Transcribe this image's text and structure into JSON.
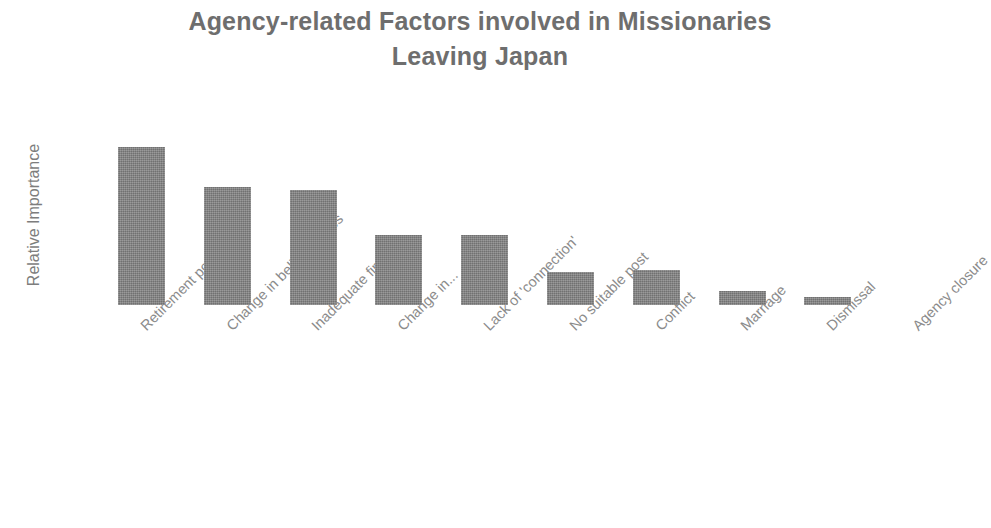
{
  "chart_data": {
    "type": "bar",
    "title": "Agency-related Factors involved in Missionaries\nLeaving Japan",
    "title_line1": "Agency-related Factors involved in Missionaries",
    "title_line2": "Leaving Japan",
    "xlabel": "",
    "ylabel": "Relative Importance",
    "ylim": [
      0,
      100
    ],
    "grid": false,
    "legend": false,
    "axis_tick_labels_y": [],
    "bar_color": "#848484",
    "text_color": "#8b8b8b",
    "title_color": "#6e6e6e",
    "categories": [
      "Retirement policy",
      "Change in beliefs/values",
      "Inadequate finance",
      "Change in...",
      "Lack of 'connection'",
      "No suitable post",
      "Conflict",
      "Marriage",
      "Dismissal",
      "Agency closure"
    ],
    "values": [
      100,
      75,
      73,
      44,
      44,
      21,
      22,
      9,
      5,
      0
    ],
    "series": [
      {
        "name": "Relative Importance",
        "values": [
          100,
          75,
          73,
          44,
          44,
          21,
          22,
          9,
          5,
          0
        ]
      }
    ]
  },
  "layout": {
    "baseline_y": 305,
    "plot_top_y": 140,
    "bar_width": 47,
    "bar_step": 85.8,
    "first_bar_x": 118,
    "max_bar_height": 158
  }
}
